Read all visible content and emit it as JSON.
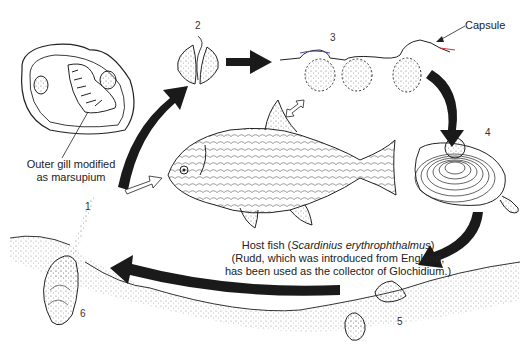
{
  "diagram": {
    "stages": [
      {
        "id": "1",
        "label": "1"
      },
      {
        "id": "2",
        "label": "2"
      },
      {
        "id": "3",
        "label": "3"
      },
      {
        "id": "4",
        "label": "4"
      },
      {
        "id": "5",
        "label": "5"
      },
      {
        "id": "6",
        "label": "6"
      }
    ],
    "annotations": {
      "marsupium_line1": "Outer gill modified",
      "marsupium_line2": "as marsupium",
      "capsule": "Capsule"
    },
    "caption": {
      "line1_prefix": "Host fish (",
      "line1_species": "Scardinius erythrophthalmus",
      "line1_suffix": ")",
      "line2": "(Rudd, which was introduced from England,",
      "line3": "has been used as the collector of Glochidium.)"
    },
    "colors": {
      "ink": "#1a1a1a",
      "background": "#ffffff",
      "stipple": "#888888"
    }
  }
}
